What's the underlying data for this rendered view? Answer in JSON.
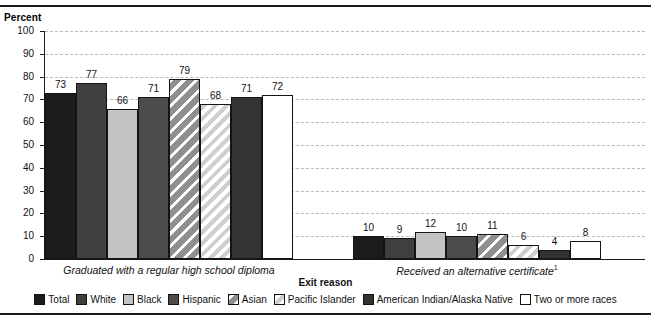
{
  "header": {
    "clipped_title": "",
    "y_axis_label": "Percent"
  },
  "axis": {
    "x_title": "Exit reason",
    "y_ticks": [
      "100",
      "90",
      "80",
      "70",
      "60",
      "50",
      "40",
      "30",
      "20",
      "10",
      "0"
    ]
  },
  "groups": [
    {
      "caption": "Graduated with a regular high school diploma",
      "footnote": ""
    },
    {
      "caption": "Received an alternative certificate",
      "footnote": "1"
    }
  ],
  "legend": {
    "items": [
      {
        "label": "Total",
        "key": "total",
        "color": "#1c1c1c"
      },
      {
        "label": "White",
        "key": "white",
        "color": "#3f3f3f"
      },
      {
        "label": "Black",
        "key": "black",
        "color": "#c3c3c3"
      },
      {
        "label": "Hispanic",
        "key": "hispanic",
        "color": "#4c4c4c"
      },
      {
        "label": "Asian",
        "key": "asian",
        "color": "#8f8f8f"
      },
      {
        "label": "Pacific Islander",
        "key": "pacific",
        "color": "#ffffff"
      },
      {
        "label": "American Indian/Alaska Native",
        "key": "amind",
        "color": "#333333"
      },
      {
        "label": "Two or more races",
        "key": "two",
        "color": "#ffffff"
      }
    ]
  },
  "chart_data": {
    "type": "bar",
    "title": "",
    "xlabel": "Exit reason",
    "ylabel": "Percent",
    "ylim": [
      0,
      100
    ],
    "ytick_step": 10,
    "grid": true,
    "legend_position": "bottom",
    "categories": [
      "Graduated with a regular high school diploma",
      "Received an alternative certificate"
    ],
    "series": [
      {
        "name": "Total",
        "values": [
          73,
          10
        ]
      },
      {
        "name": "White",
        "values": [
          77,
          9
        ]
      },
      {
        "name": "Black",
        "values": [
          66,
          12
        ]
      },
      {
        "name": "Hispanic",
        "values": [
          71,
          10
        ]
      },
      {
        "name": "Asian",
        "values": [
          79,
          11
        ]
      },
      {
        "name": "Pacific Islander",
        "values": [
          68,
          6
        ]
      },
      {
        "name": "American Indian/Alaska Native",
        "values": [
          71,
          4
        ]
      },
      {
        "name": "Two or more races",
        "values": [
          72,
          8
        ]
      }
    ]
  }
}
